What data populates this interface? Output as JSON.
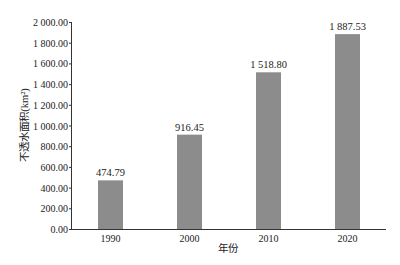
{
  "chart_data": {
    "type": "bar",
    "title": "",
    "xlabel": "年份",
    "ylabel": "不透水面积(km²)",
    "categories": [
      "1990",
      "2000",
      "2010",
      "2020"
    ],
    "values": [
      474.79,
      916.45,
      1518.8,
      1887.53
    ],
    "value_labels": [
      "474.79",
      "916.45",
      "1 518.80",
      "1 887.53"
    ],
    "ylim": [
      0,
      2000
    ],
    "yticks": [
      0,
      200,
      400,
      600,
      800,
      1000,
      1200,
      1400,
      1600,
      1800,
      2000
    ],
    "ytick_labels": [
      "0.00",
      "200.00",
      "400.00",
      "600.00",
      "800.00",
      "1 000.00",
      "1 200.00",
      "1 400.00",
      "1 600.00",
      "1 800.00",
      "2 000.00"
    ],
    "grid": false,
    "legend": null,
    "bar_color": "#8c8c8c"
  }
}
